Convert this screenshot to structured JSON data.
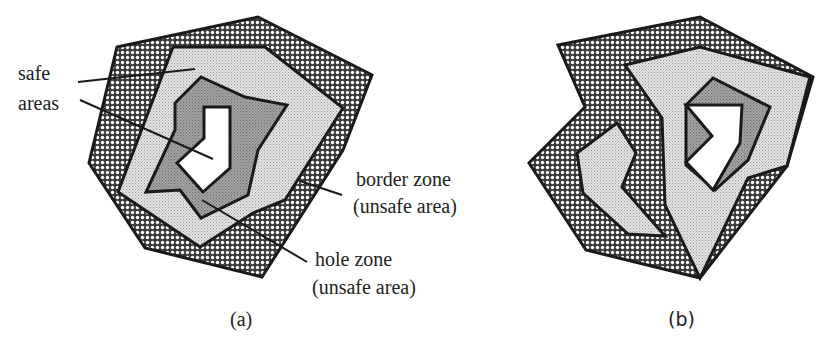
{
  "figure": {
    "panels": [
      {
        "id": "a",
        "caption": "(a)",
        "labels": {
          "safe": "safe",
          "areas": "areas",
          "border_zone": "border zone",
          "border_zone_note": "(unsafe area)",
          "hole_zone": "hole zone",
          "hole_zone_note": "(unsafe area)"
        }
      },
      {
        "id": "b",
        "caption": "(b)"
      }
    ],
    "legend_semantics": {
      "crosshatch": "border zone (unsafe area)",
      "light_dot": "safe area",
      "dark_dot": "hole zone (unsafe area)",
      "white": "hole"
    },
    "colors": {
      "stroke": "#1a1a1a",
      "border_zone_bg": "#3a3a3a",
      "border_zone_dots": "#ffffff",
      "safe_area": "#d6d6d6",
      "hole_zone": "#9a9a9a",
      "hole": "#ffffff"
    }
  }
}
